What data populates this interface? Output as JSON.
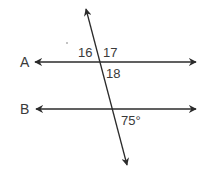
{
  "diagram": {
    "lines": {
      "A": {
        "label": "A"
      },
      "B": {
        "label": "B"
      }
    },
    "angles": {
      "a16": "16",
      "a17": "17",
      "a18": "18",
      "given": "75°"
    },
    "colors": {
      "stroke": "#2b2b2b",
      "text": "#3a3a3a"
    }
  }
}
